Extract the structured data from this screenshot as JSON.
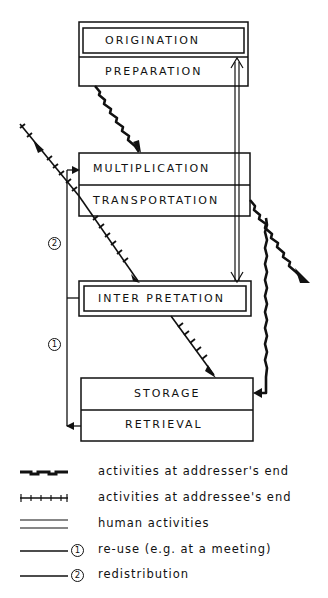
{
  "diagram": {
    "boxes": {
      "top": {
        "upper": "ORIGINATION",
        "lower": "PREPARATION"
      },
      "middle": {
        "upper": "MULTIPLICATION",
        "lower": "TRANSPORTATION"
      },
      "interpretation": {
        "label": "INTER PRETATION"
      },
      "bottom": {
        "upper": "STORAGE",
        "lower": "RETRIEVAL"
      }
    },
    "markers": {
      "one": "1",
      "two": "2"
    }
  },
  "legend": {
    "items": [
      {
        "symbol": "dashed-heavy-line",
        "label": "activities at addresser's end"
      },
      {
        "symbol": "tick-marked-line",
        "label": "activities at addressee's end"
      },
      {
        "symbol": "double-line",
        "label": "human activities"
      },
      {
        "symbol": "line-with-marker-1",
        "marker": "1",
        "label": "re-use (e.g. at a meeting)"
      },
      {
        "symbol": "line-with-marker-2",
        "marker": "2",
        "label": "redistribution"
      }
    ]
  },
  "colors": {
    "ink": "#111111",
    "background": "#ffffff"
  }
}
